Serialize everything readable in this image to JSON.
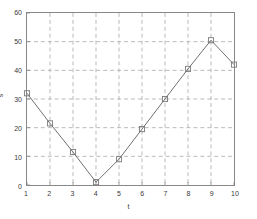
{
  "chart_data": {
    "type": "line",
    "title": "",
    "xlabel": "t",
    "ylabel": "s",
    "x": [
      1,
      2,
      3,
      4,
      5,
      6,
      7,
      8,
      9,
      10
    ],
    "values": [
      32,
      21.5,
      11.5,
      1,
      9,
      19.5,
      30,
      40.5,
      50.5,
      42
    ],
    "series": [
      {
        "name": "s",
        "x": [
          1,
          2,
          3,
          4,
          5,
          6,
          7,
          8,
          9,
          10
        ],
        "values": [
          32,
          21.5,
          11.5,
          1,
          9,
          19.5,
          30,
          40.5,
          50.5,
          42
        ]
      }
    ],
    "xlim": [
      1,
      10
    ],
    "ylim": [
      0,
      60
    ],
    "xticks": [
      "1",
      "2",
      "3",
      "4",
      "5",
      "6",
      "7",
      "8",
      "9",
      "10"
    ],
    "xtick_values": [
      1,
      2,
      3,
      4,
      5,
      6,
      7,
      8,
      9,
      10
    ],
    "yticks": [
      "0",
      "10",
      "20",
      "30",
      "40",
      "50",
      "60"
    ],
    "ytick_values": [
      0,
      10,
      20,
      30,
      40,
      50,
      60
    ],
    "grid": true,
    "grid_style": "dashed",
    "legend": null,
    "marker": "square",
    "line_color": "#6e6e6e",
    "marker_color": "#7a7a7a",
    "grid_color": "#a9a9a9",
    "axis_color": "#888888",
    "background_color": "#ffffff"
  }
}
